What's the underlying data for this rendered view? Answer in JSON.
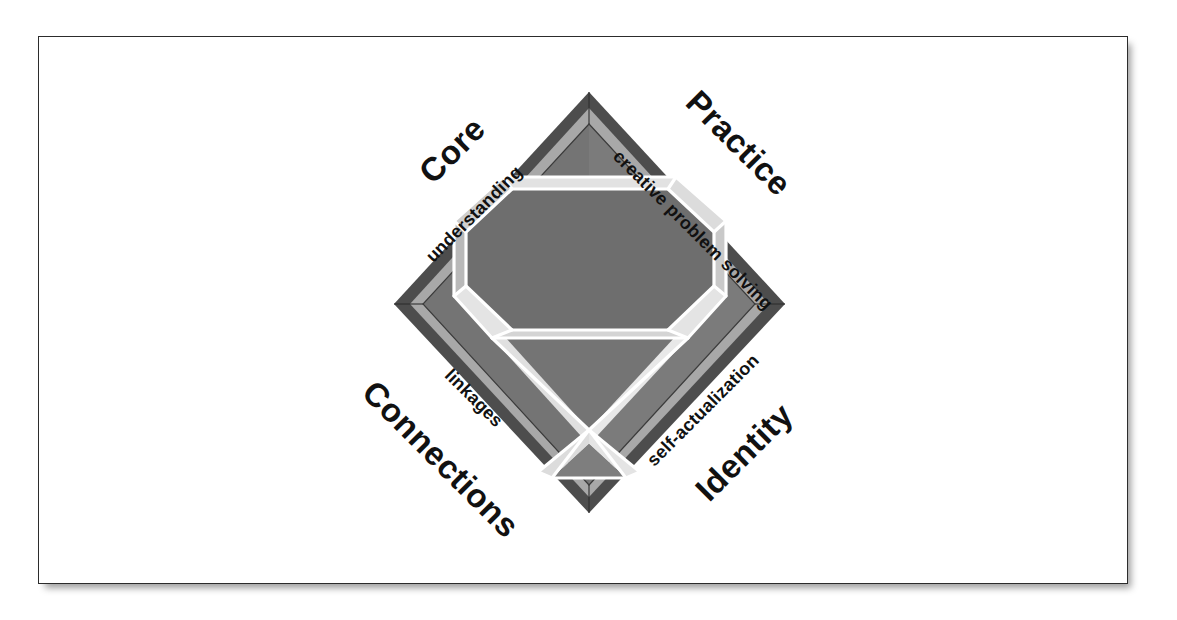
{
  "figure": {
    "kind": "concept-diagram",
    "shape": "diamond",
    "center_motif": "cut-gemstone"
  },
  "frame": {
    "border_color": "#2c2c2c",
    "background": "#ffffff"
  },
  "palette": {
    "outer_bevel_dark": "#4d4d4d",
    "mid_band_light": "#a3a3a3",
    "field_dark": "#7b7b7b",
    "gem_table_dark": "#6e6e6e",
    "gem_facet_light": "#d9d9d9",
    "gem_facet_mid": "#c2c2c2",
    "gem_outline": "#ffffff",
    "text": "#111111"
  },
  "quadrants": [
    {
      "id": "core",
      "major_label": "Core",
      "minor_label": "understanding",
      "position": "top-left",
      "rotation_deg": -45
    },
    {
      "id": "practice",
      "major_label": "Practice",
      "minor_label": "creative problem solving",
      "position": "top-right",
      "rotation_deg": 45
    },
    {
      "id": "connections",
      "major_label": "Connections",
      "minor_label": "linkages",
      "position": "bottom-left",
      "rotation_deg": 45
    },
    {
      "id": "identity",
      "major_label": "Identity",
      "minor_label": "self-actualization",
      "position": "bottom-right",
      "rotation_deg": -45
    }
  ],
  "labels": {
    "core_major": "Core",
    "core_minor": "understanding",
    "practice_major": "Practice",
    "practice_minor": "creative problem solving",
    "connections_major": "Connections",
    "connections_minor": "linkages",
    "identity_major": "Identity",
    "identity_minor": "self-actualization"
  }
}
